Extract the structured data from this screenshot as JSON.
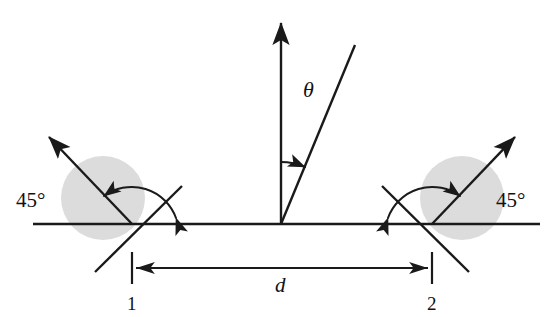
{
  "figure": {
    "type": "optical-geometry-diagram",
    "canvas": {
      "width": 560,
      "height": 317,
      "background": "#ffffff"
    },
    "ink_color": "#1a1a1a",
    "disc_color": "#dcdcdc"
  },
  "labels": {
    "angle_left": "45°",
    "angle_right": "45°",
    "theta": "θ",
    "distance": "d",
    "station_left": "1",
    "station_right": "2"
  },
  "geometry": {
    "baseline": {
      "x1": 33,
      "y1": 224,
      "x2": 540,
      "y2": 224
    },
    "origin": {
      "x": 281,
      "y": 224
    },
    "vertex_left": {
      "x": 132,
      "y": 224
    },
    "vertex_right": {
      "x": 432,
      "y": 224
    },
    "normal_arrow": {
      "x1": 281,
      "y1": 224,
      "x2": 281,
      "y2": 18
    },
    "theta_ray": {
      "x1": 281,
      "y1": 224,
      "x2": 355,
      "y2": 45
    },
    "theta_arc": {
      "radius": 62,
      "start_deg": 90,
      "end_deg": 67.5
    },
    "disc_left": {
      "cx": 103,
      "cy": 198,
      "r": 42
    },
    "disc_right": {
      "cx": 462,
      "cy": 198,
      "r": 42
    },
    "beam_left": {
      "x1": 132,
      "y1": 224,
      "x2": 45,
      "y2": 133
    },
    "beam_right": {
      "x1": 432,
      "y1": 224,
      "x2": 519,
      "y2": 133
    },
    "mirror_left": {
      "x1": 95,
      "y1": 272,
      "x2": 182,
      "y2": 186
    },
    "mirror_right": {
      "x1": 469,
      "y1": 272,
      "x2": 382,
      "y2": 186
    },
    "arc_45_left": {
      "radius": 47,
      "start_deg": 0,
      "end_deg": 45
    },
    "arc_45_right": {
      "radius": 47,
      "start_deg": 180,
      "end_deg": 135
    },
    "dimension_line": {
      "y": 268,
      "x1": 132,
      "x2": 432
    },
    "tick_height": {
      "top": 252,
      "bottom": 284
    }
  },
  "label_positions": {
    "angle_left": {
      "x": 16,
      "y": 207
    },
    "angle_right": {
      "x": 496,
      "y": 207
    },
    "theta": {
      "x": 303,
      "y": 97
    },
    "distance": {
      "x": 275,
      "y": 292
    },
    "station_left": {
      "x": 127,
      "y": 310
    },
    "station_right": {
      "x": 427,
      "y": 310
    }
  }
}
